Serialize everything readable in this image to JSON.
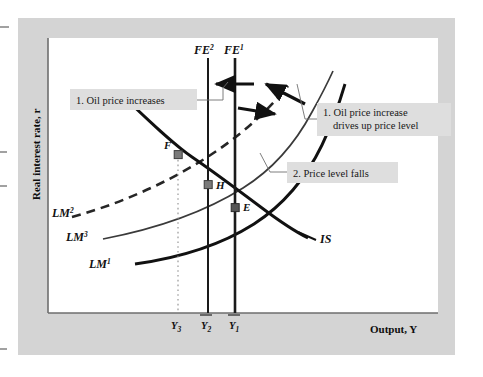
{
  "figure": {
    "kind": "economics-diagram",
    "background_color": "#ffffff",
    "frame_color": "#d4d4d4",
    "plot_background": "#ffffff",
    "axis_color": "#6e6e6e",
    "curve_color": "#1a1a1a"
  },
  "axes": {
    "y_title": "Real interest rate, r",
    "x_title": "Output, Y"
  },
  "x_ticks": [
    {
      "label": "Y",
      "sub": "3",
      "bar": false,
      "dotted": true
    },
    {
      "label": "Y",
      "sub": "2",
      "bar": true,
      "dotted": false
    },
    {
      "label": "Y",
      "sub": "1",
      "bar": true,
      "dotted": false
    }
  ],
  "vertical_lines": [
    {
      "name": "FE2",
      "label": "FE",
      "sup": "2",
      "style": "solid"
    },
    {
      "name": "FE1",
      "label": "FE",
      "sup": "1",
      "style": "solid"
    }
  ],
  "curves": [
    {
      "name": "LM2",
      "label": "LM",
      "sup": "2",
      "style": "dashed"
    },
    {
      "name": "LM3",
      "label": "LM",
      "sup": "3",
      "style": "thin-solid"
    },
    {
      "name": "LM1",
      "label": "LM",
      "sup": "1",
      "style": "thick-solid"
    },
    {
      "name": "IS",
      "label": "IS",
      "sup": "",
      "style": "thick-solid"
    }
  ],
  "points": [
    {
      "name": "F",
      "label": "F"
    },
    {
      "name": "H",
      "label": "H"
    },
    {
      "name": "E",
      "label": "E"
    }
  ],
  "callouts": [
    {
      "name": "oil-price-increases",
      "lines": [
        "1. Oil price increases"
      ],
      "background": "#dedede"
    },
    {
      "name": "oil-price-drives-up-price-level",
      "lines": [
        "1. Oil price increase",
        "drives up price level"
      ],
      "background": "#dedede"
    },
    {
      "name": "price-level-falls",
      "lines": [
        "2. Price level falls"
      ],
      "background": "#dedede"
    }
  ]
}
